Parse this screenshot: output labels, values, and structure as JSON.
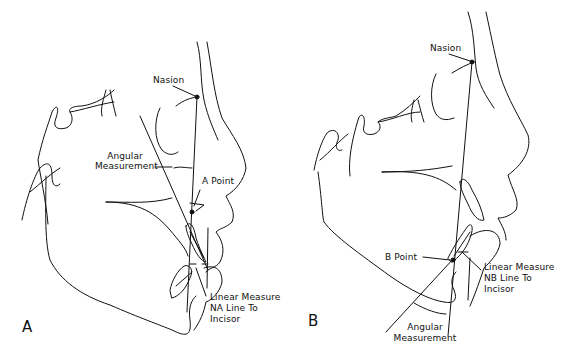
{
  "figure": {
    "type": "cephalometric-tracing",
    "line_color": "#111111",
    "background": "#ffffff",
    "panels": [
      {
        "id": "A",
        "letter": "A",
        "labels": {
          "nasion": "Nasion",
          "angular_1": "Angular",
          "angular_2": "Measurement",
          "a_point": "A Point",
          "linear_1": "Linear Measure",
          "linear_2": "NA Line To",
          "linear_3": "Incisor"
        }
      },
      {
        "id": "B",
        "letter": "B",
        "labels": {
          "nasion": "Nasion",
          "b_point": "B Point",
          "linear_1": "Linear Measure",
          "linear_2": "NB Line To",
          "linear_3": "Incisor",
          "angular_1": "Angular",
          "angular_2": "Measurement"
        }
      }
    ]
  }
}
